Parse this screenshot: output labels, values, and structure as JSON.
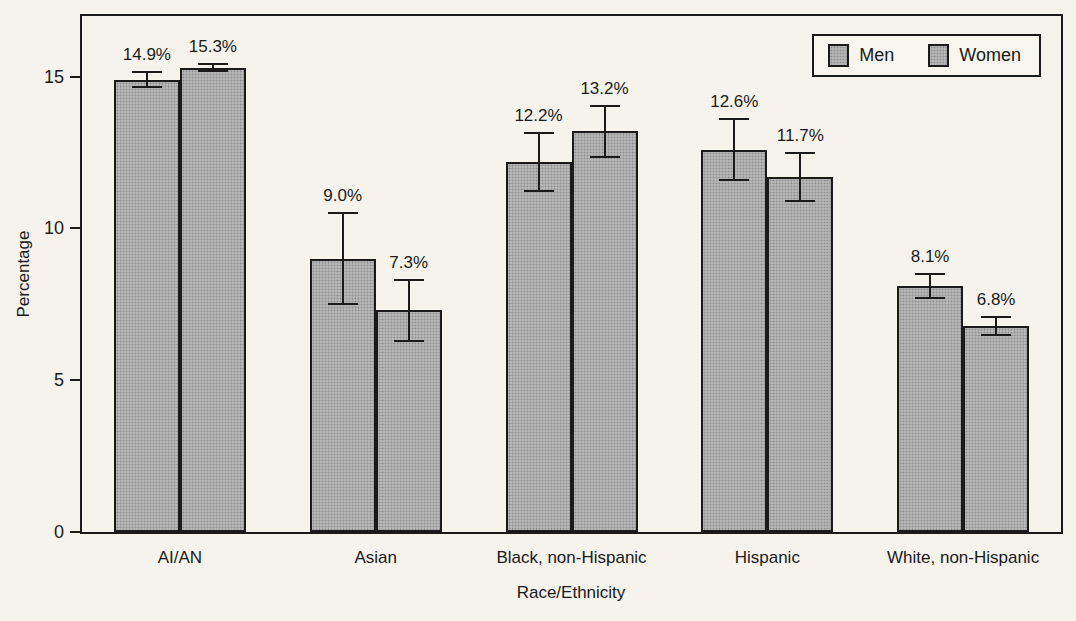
{
  "figure": {
    "background": "#f5f3ec",
    "line_color": "#1a1a1a"
  },
  "chart_data": {
    "type": "bar",
    "title": "",
    "categories": [
      "AI/AN",
      "Asian",
      "Black, non-Hispanic",
      "Hispanic",
      "White, non-Hispanic"
    ],
    "series": [
      {
        "name": "Men",
        "values": [
          14.9,
          9.0,
          12.2,
          12.6,
          8.1
        ],
        "errors": [
          0.25,
          1.5,
          0.95,
          1.0,
          0.4
        ],
        "labels": [
          "14.9%",
          "9.0%",
          "12.2%",
          "12.6%",
          "8.1%"
        ]
      },
      {
        "name": "Women",
        "values": [
          15.3,
          7.3,
          13.2,
          11.7,
          6.8
        ],
        "errors": [
          0.12,
          1.0,
          0.85,
          0.8,
          0.3
        ],
        "labels": [
          "15.3%",
          "7.3%",
          "13.2%",
          "11.7%",
          "6.8%"
        ]
      }
    ],
    "xlabel": "Race/Ethnicity",
    "ylabel": "Percentage",
    "yticks": [
      0,
      5,
      10,
      15
    ],
    "ytick_labels": [
      "0",
      "5",
      "10",
      "15"
    ],
    "ylim": [
      0,
      17
    ],
    "grid": false,
    "legend_position": "top-right",
    "error_bars": true,
    "bar_fill": "#b6b6b6",
    "bar_dot": "#8d8d8d",
    "bar_border": "#1a1a1a"
  }
}
